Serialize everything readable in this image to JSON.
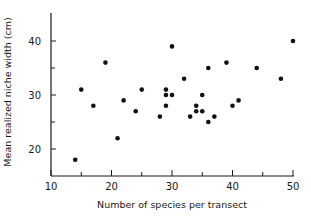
{
  "chart_data": {
    "type": "scatter",
    "title": "",
    "xlabel": "Number of species per transect",
    "ylabel": "Mean realized niche width (cm)",
    "xlim": [
      10,
      50
    ],
    "ylim": [
      15,
      45
    ],
    "x_ticks": [
      10,
      20,
      30,
      40,
      50
    ],
    "x_minor_ticks": [
      15,
      25,
      35,
      45
    ],
    "y_ticks": [
      20,
      30,
      40
    ],
    "y_minor_ticks": [
      25,
      35
    ],
    "grid": false,
    "legend": null,
    "series": [
      {
        "name": "transects",
        "points": [
          {
            "x": 14,
            "y": 18
          },
          {
            "x": 15,
            "y": 31
          },
          {
            "x": 17,
            "y": 28
          },
          {
            "x": 19,
            "y": 36
          },
          {
            "x": 21,
            "y": 22
          },
          {
            "x": 22,
            "y": 29
          },
          {
            "x": 24,
            "y": 27
          },
          {
            "x": 25,
            "y": 31
          },
          {
            "x": 28,
            "y": 26
          },
          {
            "x": 29,
            "y": 31
          },
          {
            "x": 29,
            "y": 30
          },
          {
            "x": 29,
            "y": 28
          },
          {
            "x": 30,
            "y": 39
          },
          {
            "x": 30,
            "y": 30
          },
          {
            "x": 32,
            "y": 33
          },
          {
            "x": 33,
            "y": 26
          },
          {
            "x": 34,
            "y": 28
          },
          {
            "x": 34,
            "y": 27
          },
          {
            "x": 35,
            "y": 30
          },
          {
            "x": 35,
            "y": 27
          },
          {
            "x": 36,
            "y": 35
          },
          {
            "x": 36,
            "y": 25
          },
          {
            "x": 37,
            "y": 26
          },
          {
            "x": 39,
            "y": 36
          },
          {
            "x": 40,
            "y": 28
          },
          {
            "x": 41,
            "y": 29
          },
          {
            "x": 44,
            "y": 35
          },
          {
            "x": 48,
            "y": 33
          },
          {
            "x": 50,
            "y": 40
          }
        ]
      }
    ]
  },
  "labels": {
    "x_axis_title": "Number of species per transect",
    "y_axis_title": "Mean realized niche width (cm)"
  }
}
